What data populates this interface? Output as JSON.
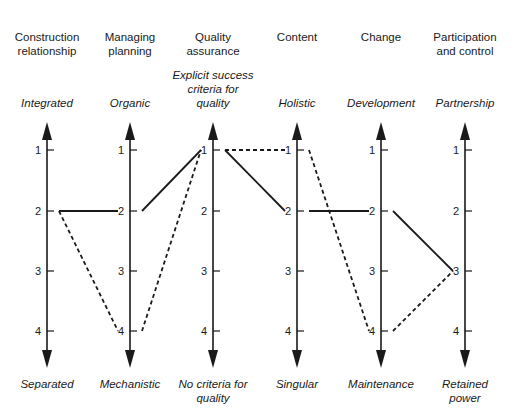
{
  "chart_data": {
    "type": "parallel-coordinates",
    "axes": [
      {
        "title": "Construction relationship",
        "top_label": "Integrated",
        "bottom_label": "Separated"
      },
      {
        "title": "Managing planning",
        "top_label": "Organic",
        "bottom_label": "Mechanistic"
      },
      {
        "title": "Quality assurance",
        "top_label": "Explicit success criteria for quality",
        "bottom_label": "No criteria for quality"
      },
      {
        "title": "Content",
        "top_label": "Holistic",
        "bottom_label": "Singular"
      },
      {
        "title": "Change",
        "top_label": "Development",
        "bottom_label": "Maintenance"
      },
      {
        "title": "Participation and control",
        "top_label": "Partnership",
        "bottom_label": "Retained power"
      }
    ],
    "ticks": [
      "1",
      "2",
      "3",
      "4"
    ],
    "series": [
      {
        "name": "solid",
        "style": "solid",
        "values": [
          2,
          2,
          1,
          2,
          2,
          3
        ]
      },
      {
        "name": "dashed",
        "style": "dashed",
        "values": [
          2,
          4,
          1,
          1,
          4,
          3
        ]
      }
    ]
  },
  "axes_titles": [
    [
      "Construction",
      "relationship"
    ],
    [
      "Managing",
      "planning"
    ],
    [
      "Quality",
      "assurance"
    ],
    [
      "Content"
    ],
    [
      "Change"
    ],
    [
      "Participation",
      "and control"
    ]
  ],
  "top_labels": [
    [
      "Integrated"
    ],
    [
      "Organic"
    ],
    [
      "Explicit success",
      "criteria for",
      "quality"
    ],
    [
      "Holistic"
    ],
    [
      "Development"
    ],
    [
      "Partnership"
    ]
  ],
  "bottom_labels": [
    [
      "Separated"
    ],
    [
      "Mechanistic"
    ],
    [
      "No criteria for",
      "quality"
    ],
    [
      "Singular"
    ],
    [
      "Maintenance"
    ],
    [
      "Retained",
      "power"
    ]
  ]
}
